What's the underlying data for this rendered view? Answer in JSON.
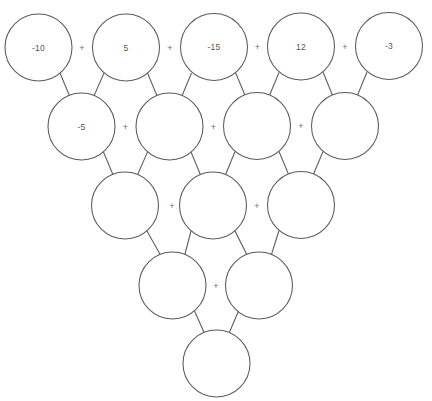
{
  "puzzle": {
    "type": "addition-pyramid",
    "operator_symbol": "+",
    "stroke_color": "#5a5a5a",
    "text_color": "#555555",
    "background_color": "#ffffff",
    "rows": [
      {
        "index": 0,
        "circles": [
          {
            "id": "r0c0",
            "value": "-10",
            "cx": 38.5,
            "cy": 47.5,
            "r": 33.5
          },
          {
            "id": "r0c1",
            "value": "5",
            "cx": 126.0,
            "cy": 47.5,
            "r": 33.5
          },
          {
            "id": "r0c2",
            "value": "-15",
            "cx": 214.0,
            "cy": 47.0,
            "r": 33.5
          },
          {
            "id": "r0c3",
            "value": "12",
            "cx": 301.0,
            "cy": 46.5,
            "r": 33.5
          },
          {
            "id": "r0c4",
            "value": "-3",
            "cx": 389.0,
            "cy": 46.0,
            "r": 33.5
          }
        ],
        "operators": [
          {
            "x": 82.0,
            "y": 47.5
          },
          {
            "x": 170.0,
            "y": 47.5
          },
          {
            "x": 257.5,
            "y": 47.0
          },
          {
            "x": 345.0,
            "y": 46.5
          }
        ]
      },
      {
        "index": 1,
        "circles": [
          {
            "id": "r1c0",
            "value": "-5",
            "cx": 81.5,
            "cy": 126.5,
            "r": 33.5
          },
          {
            "id": "r1c1",
            "value": "",
            "cx": 169.5,
            "cy": 126.5,
            "r": 33.5
          },
          {
            "id": "r1c2",
            "value": "",
            "cx": 257.0,
            "cy": 126.0,
            "r": 33.5
          },
          {
            "id": "r1c3",
            "value": "",
            "cx": 345.0,
            "cy": 126.0,
            "r": 33.5
          }
        ],
        "operators": [
          {
            "x": 125.5,
            "y": 126.5
          },
          {
            "x": 213.5,
            "y": 126.5
          },
          {
            "x": 301.0,
            "y": 126.0
          }
        ]
      },
      {
        "index": 2,
        "circles": [
          {
            "id": "r2c0",
            "value": "",
            "cx": 125.0,
            "cy": 205.5,
            "r": 33.5
          },
          {
            "id": "r2c1",
            "value": "",
            "cx": 213.0,
            "cy": 205.5,
            "r": 33.5
          },
          {
            "id": "r2c2",
            "value": "",
            "cx": 301.0,
            "cy": 205.0,
            "r": 33.5
          }
        ],
        "operators": [
          {
            "x": 172.0,
            "y": 205.5
          },
          {
            "x": 257.0,
            "y": 205.5
          }
        ]
      },
      {
        "index": 3,
        "circles": [
          {
            "id": "r3c0",
            "value": "",
            "cx": 172.5,
            "cy": 285.5,
            "r": 33.5
          },
          {
            "id": "r3c1",
            "value": "",
            "cx": 259.0,
            "cy": 285.5,
            "r": 33.5
          }
        ],
        "operators": [
          {
            "x": 216.0,
            "y": 286.0
          }
        ]
      },
      {
        "index": 4,
        "circles": [
          {
            "id": "r4c0",
            "value": "",
            "cx": 216.5,
            "cy": 363.5,
            "r": 33.5
          }
        ],
        "operators": []
      }
    ],
    "connectors": [
      {
        "x1": 60.0,
        "y1": 73.0,
        "x2": 70.0,
        "y2": 97.0
      },
      {
        "x1": 104.0,
        "y1": 73.0,
        "x2": 93.5,
        "y2": 97.0
      },
      {
        "x1": 147.5,
        "y1": 73.0,
        "x2": 157.5,
        "y2": 97.0
      },
      {
        "x1": 191.5,
        "y1": 73.0,
        "x2": 181.5,
        "y2": 97.0
      },
      {
        "x1": 235.5,
        "y1": 72.5,
        "x2": 245.5,
        "y2": 96.5
      },
      {
        "x1": 279.0,
        "y1": 72.5,
        "x2": 269.0,
        "y2": 96.5
      },
      {
        "x1": 323.0,
        "y1": 72.0,
        "x2": 333.0,
        "y2": 96.5
      },
      {
        "x1": 367.0,
        "y1": 72.0,
        "x2": 357.0,
        "y2": 96.5
      },
      {
        "x1": 103.5,
        "y1": 152.0,
        "x2": 113.5,
        "y2": 176.0
      },
      {
        "x1": 147.5,
        "y1": 152.0,
        "x2": 137.0,
        "y2": 176.0
      },
      {
        "x1": 191.0,
        "y1": 152.0,
        "x2": 201.0,
        "y2": 176.0
      },
      {
        "x1": 235.0,
        "y1": 151.5,
        "x2": 225.0,
        "y2": 176.0
      },
      {
        "x1": 279.0,
        "y1": 151.5,
        "x2": 289.0,
        "y2": 175.5
      },
      {
        "x1": 323.0,
        "y1": 151.5,
        "x2": 313.0,
        "y2": 175.5
      },
      {
        "x1": 147.0,
        "y1": 231.0,
        "x2": 161.0,
        "y2": 256.0
      },
      {
        "x1": 191.0,
        "y1": 231.0,
        "x2": 184.5,
        "y2": 256.0
      },
      {
        "x1": 235.0,
        "y1": 231.0,
        "x2": 247.5,
        "y2": 256.0
      },
      {
        "x1": 279.0,
        "y1": 230.5,
        "x2": 271.0,
        "y2": 256.0
      },
      {
        "x1": 194.5,
        "y1": 311.0,
        "x2": 205.0,
        "y2": 334.5
      },
      {
        "x1": 238.5,
        "y1": 311.0,
        "x2": 228.5,
        "y2": 334.5
      }
    ]
  }
}
